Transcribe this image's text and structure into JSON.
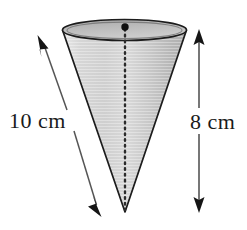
{
  "figure": {
    "shape_name": "cone",
    "background_color": "#ffffff",
    "outline_color": "#1a1a1a",
    "fill_color": "#c9c9c9",
    "fill_color_light": "#e2e2e2",
    "ellipse_top_fill": "#b8b8b8",
    "annotation_color": "#4a4a4a"
  },
  "labels": {
    "slant_height": "10 cm",
    "height": "8 cm"
  },
  "geometry": {
    "top_ellipse": {
      "center_x": 124.5,
      "center_y": 30,
      "radius_x": 62,
      "radius_y": 10.5
    },
    "apex": {
      "x": 125,
      "y": 212
    },
    "center_dot": {
      "x": 125,
      "y": 27,
      "radius": 3.6
    },
    "axis_line": {
      "x1": 125,
      "y1": 30,
      "x2": 125,
      "y2": 210,
      "style": "dotted"
    },
    "slant_arrow": {
      "x1": 38,
      "y1": 36,
      "x2": 101,
      "y2": 216
    },
    "height_arrow": {
      "x": 199,
      "y1": 30,
      "y2": 212
    }
  },
  "measurements": {
    "slant_height_value": 10,
    "slant_height_unit": "cm",
    "height_value": 8,
    "height_unit": "cm"
  }
}
